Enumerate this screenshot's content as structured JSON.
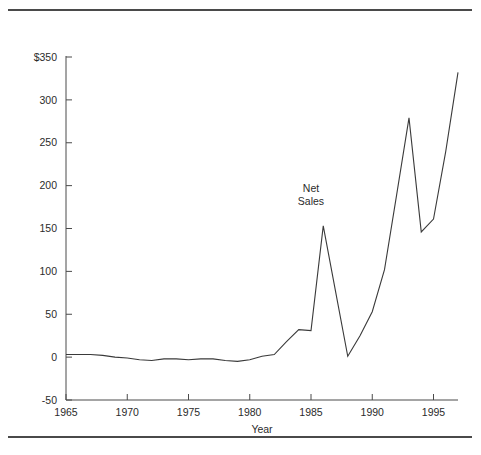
{
  "page": {
    "clipped_header_text": "",
    "background_color": "#ffffff"
  },
  "rules": {
    "top_rule_name": "top-horizontal-rule",
    "bottom_rule_name": "bottom-horizontal-rule",
    "color": "#4a4a4a"
  },
  "chart_data": {
    "type": "line",
    "title": "",
    "xlabel": "Year",
    "ylabel": "",
    "series_annotation": "Net Sales",
    "annotation_line1": "Net",
    "annotation_line2": "Sales",
    "grid": false,
    "legend_position": "inline-annotation",
    "line_color": "#3a3a3a",
    "xlim": [
      1965,
      1997
    ],
    "ylim": [
      -50,
      350
    ],
    "xticks": [
      1965,
      1970,
      1975,
      1980,
      1985,
      1990,
      1995
    ],
    "xtick_labels": [
      "1965",
      "1970",
      "1975",
      "1980",
      "1985",
      "1990",
      "1995"
    ],
    "yticks": [
      -50,
      0,
      50,
      100,
      150,
      200,
      250,
      300,
      350
    ],
    "ytick_labels": [
      "-50",
      "0",
      "50",
      "100",
      "150",
      "200",
      "250",
      "300",
      "$350"
    ],
    "x": [
      1965,
      1966,
      1967,
      1968,
      1969,
      1970,
      1971,
      1972,
      1973,
      1974,
      1975,
      1976,
      1977,
      1978,
      1979,
      1980,
      1981,
      1982,
      1983,
      1984,
      1985,
      1986,
      1987,
      1988,
      1989,
      1990,
      1991,
      1992,
      1993,
      1994,
      1995,
      1996,
      1997
    ],
    "values": [
      3,
      3,
      3,
      2,
      0,
      -1,
      -3,
      -4,
      -2,
      -2,
      -3,
      -2,
      -2,
      -4,
      -5,
      -3,
      1,
      3,
      18,
      32,
      31,
      153,
      77,
      1,
      25,
      53,
      102,
      190,
      279,
      146,
      161,
      240,
      332
    ],
    "series": [
      {
        "name": "Net Sales",
        "values": [
          3,
          3,
          3,
          2,
          0,
          -1,
          -3,
          -4,
          -2,
          -2,
          -3,
          -2,
          -2,
          -4,
          -5,
          -3,
          1,
          3,
          18,
          32,
          31,
          153,
          77,
          1,
          25,
          53,
          102,
          190,
          279,
          146,
          161,
          240,
          332
        ]
      }
    ],
    "annotation_position": {
      "x": 1985,
      "y": 192
    }
  }
}
